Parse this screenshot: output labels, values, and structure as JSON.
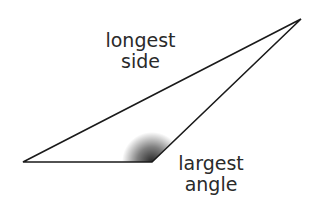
{
  "diagram": {
    "type": "obtuse-triangle",
    "vertices": {
      "left": [
        23,
        162
      ],
      "obtuse": [
        152,
        162
      ],
      "top_right": [
        301,
        19
      ]
    },
    "labels": {
      "longest_side": {
        "line1": "longest",
        "line2": "side"
      },
      "largest_angle": {
        "line1": "largest",
        "line2": "angle"
      }
    },
    "colors": {
      "stroke": "#1a1a1a",
      "text": "#2a2a2a",
      "shading": "#000000"
    }
  }
}
